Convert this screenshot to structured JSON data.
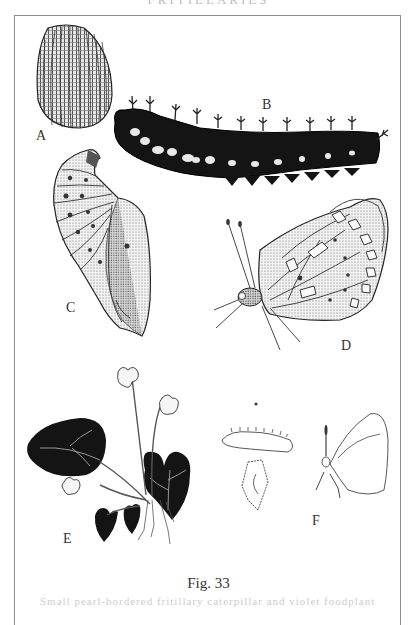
{
  "page": {
    "header_text": "FRITILLARIES",
    "figure_caption": "Fig. 33",
    "footer_text": "Small pearl-bordered fritillary caterpillar and violet foodplant",
    "frame_color": "#8d8d8d"
  },
  "illustrations": [
    {
      "id": "A",
      "label": "A",
      "subject": "egg"
    },
    {
      "id": "B",
      "label": "B",
      "subject": "caterpillar (larva)"
    },
    {
      "id": "C",
      "label": "C",
      "subject": "chrysalis (pupa)"
    },
    {
      "id": "D",
      "label": "D",
      "subject": "adult butterfly, underside"
    },
    {
      "id": "E",
      "label": "E",
      "subject": "violet foodplant"
    },
    {
      "id": "F",
      "label": "F",
      "subject": "actual-size outlines of egg, larva, pupa and adult"
    }
  ]
}
